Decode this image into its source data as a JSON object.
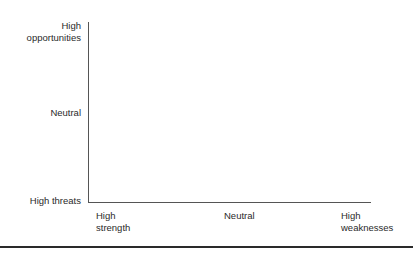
{
  "diagram": {
    "type": "2x-axis positioning grid (SWOT mapping)",
    "y_axis": {
      "labels": {
        "top": [
          "High",
          "opportunities"
        ],
        "middle": [
          "Neutral"
        ],
        "bottom": [
          "High threats"
        ]
      }
    },
    "x_axis": {
      "labels": {
        "left": [
          "High",
          "strength"
        ],
        "middle": [
          "Neutral"
        ],
        "right": [
          "High",
          "weaknesses"
        ]
      }
    },
    "colors": {
      "axis": "#555555",
      "text": "#2a2a2a",
      "rule": "#2a2a2a",
      "background": "#ffffff"
    }
  }
}
